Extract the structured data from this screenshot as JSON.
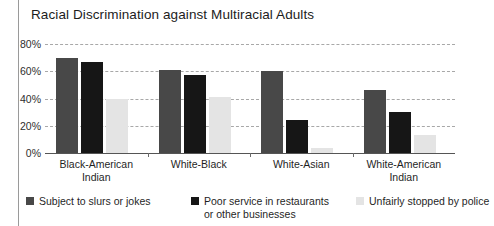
{
  "chart_data": {
    "type": "bar",
    "title": "Racial Discrimination against Multiracial Adults",
    "xlabel": "",
    "ylabel": "",
    "ylim": [
      0,
      80
    ],
    "grid": true,
    "legend_position": "bottom",
    "ytick_labels": [
      "80%",
      "60%",
      "40%",
      "20%",
      "0%"
    ],
    "ytick_values": [
      80,
      60,
      40,
      20,
      0
    ],
    "categories": [
      "Black-American Indian",
      "White-Black",
      "White-Asian",
      "White-American Indian"
    ],
    "series": [
      {
        "name": "Subject to slurs or jokes",
        "color": "#484848",
        "values": [
          70,
          61,
          60,
          46
        ]
      },
      {
        "name": "Poor service in restaurants or other businesses",
        "color": "#161616",
        "values": [
          67,
          57,
          24,
          30
        ]
      },
      {
        "name": "Unfairly stopped by police",
        "color": "#e4e4e4",
        "values": [
          40,
          41,
          4,
          13
        ]
      }
    ]
  },
  "legend": {
    "items": [
      {
        "label": "Subject to slurs or jokes"
      },
      {
        "label": "Poor service in restaurants or other businesses"
      },
      {
        "label": "Unfairly stopped by police"
      }
    ]
  }
}
